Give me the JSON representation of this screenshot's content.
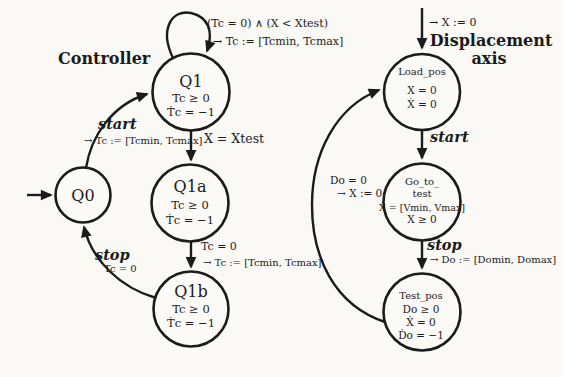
{
  "diagram": {
    "controller": {
      "title": "Controller",
      "states": {
        "q0": {
          "name": "Q0"
        },
        "q1": {
          "name": "Q1",
          "inv1": "Tc ≥ 0",
          "inv2": "Ṫc = −1"
        },
        "q1a": {
          "name": "Q1a",
          "inv1": "Tc ≥ 0",
          "inv2": "Ṫc = −1"
        },
        "q1b": {
          "name": "Q1b",
          "inv1": "Tc ≥ 0",
          "inv2": "Ṫc = −1"
        }
      },
      "transitions": {
        "start": {
          "event": "start",
          "action": "→ Tc := [Tcmin, Tcmax]"
        },
        "q1_self_loop": {
          "guard": "(Tc = 0) ∧ (X < Xtest)",
          "action": "→ Tc := [Tcmin, Tcmax]"
        },
        "q1_to_q1a": {
          "guard": "X = Xtest"
        },
        "q1a_to_q1b": {
          "guard": "Tc = 0",
          "action": "→ Tc := [Tcmin, Tcmax]"
        },
        "stop": {
          "event": "stop",
          "guard": "Tc = 0"
        }
      }
    },
    "displacement_axis": {
      "title_line1": "Displacement",
      "title_line2": "axis",
      "initial_action": "→ X := 0",
      "states": {
        "load_pos": {
          "name": "Load_pos",
          "inv1": "X = 0",
          "inv2": "Ẋ = 0"
        },
        "go_to_test": {
          "name_line1": "Go_to_",
          "name_line2": "test",
          "inv1": "Ẋ = [Vmin, Vmax]",
          "inv2": "X ≥ 0"
        },
        "test_pos": {
          "name": "Test_pos",
          "inv1": "Do ≥ 0",
          "inv2": "Ẋ = 0",
          "inv3": "Ḋo = −1"
        }
      },
      "transitions": {
        "start": {
          "event": "start"
        },
        "stop": {
          "event": "stop",
          "action": "→ Do := [Domin, Domax]"
        },
        "return": {
          "guard": "Do = 0",
          "action": "→ X := 0"
        }
      }
    }
  }
}
